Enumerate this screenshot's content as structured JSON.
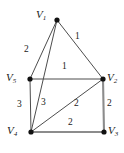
{
  "figure": {
    "name": "weighted-undirected-graph",
    "background_color": "#ffffff",
    "edge_color": "#4d4d4d",
    "thick_edge_color": "#8c8c8c",
    "node_color": "#111111",
    "text_color": "#1a1a1a",
    "width": 124,
    "height": 153
  },
  "nodes": [
    {
      "id": "V1",
      "letter": "V",
      "index": "1",
      "x": 57,
      "y": 20,
      "label_x": 36,
      "label_y": 9
    },
    {
      "id": "V2",
      "letter": "V",
      "index": "2",
      "x": 103,
      "y": 79,
      "label_x": 107,
      "label_y": 72
    },
    {
      "id": "V3",
      "letter": "V",
      "index": "3",
      "x": 104,
      "y": 132,
      "label_x": 108,
      "label_y": 125
    },
    {
      "id": "V4",
      "letter": "V",
      "index": "4",
      "x": 31,
      "y": 132,
      "label_x": 7,
      "label_y": 125
    },
    {
      "id": "V5",
      "letter": "V",
      "index": "5",
      "x": 30,
      "y": 79,
      "label_x": 6,
      "label_y": 72
    }
  ],
  "edges": [
    {
      "id": "e-v1-v5",
      "from": "V1",
      "to": "V5",
      "weight": "2",
      "label_x": 24,
      "label_y": 45,
      "style": "thin"
    },
    {
      "id": "e-v1-v2",
      "from": "V1",
      "to": "V2",
      "weight": "1",
      "label_x": 75,
      "label_y": 32,
      "style": "thin"
    },
    {
      "id": "e-v1-v4",
      "from": "V1",
      "to": "V4",
      "weight": "3",
      "label_x": 41,
      "label_y": 98,
      "style": "thin"
    },
    {
      "id": "e-v5-v2",
      "from": "V5",
      "to": "V2",
      "weight": "1",
      "label_x": 62,
      "label_y": 62,
      "style": "thin"
    },
    {
      "id": "e-v5-v4",
      "from": "V5",
      "to": "V4",
      "weight": "3",
      "label_x": 17,
      "label_y": 100,
      "style": "thin"
    },
    {
      "id": "e-v4-v2",
      "from": "V4",
      "to": "V2",
      "weight": "2",
      "label_x": 74,
      "label_y": 99,
      "style": "thin"
    },
    {
      "id": "e-v2-v3",
      "from": "V2",
      "to": "V3",
      "weight": "2",
      "label_x": 107,
      "label_y": 99,
      "style": "thick"
    },
    {
      "id": "e-v4-v3",
      "from": "V4",
      "to": "V3",
      "weight": "2",
      "label_x": 68,
      "label_y": 118,
      "style": "thick"
    }
  ],
  "graph_summary": {
    "node_count": "5",
    "edge_count": "8",
    "weights": [
      "2",
      "1",
      "3",
      "1",
      "3",
      "2",
      "2",
      "2"
    ]
  }
}
